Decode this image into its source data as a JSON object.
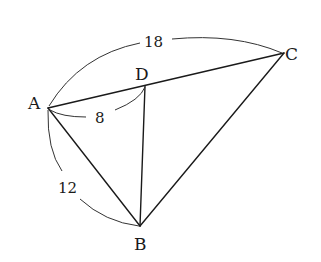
{
  "diagram": {
    "type": "geometry-triangle",
    "points": {
      "A": {
        "label": "A",
        "x": 48,
        "y": 108
      },
      "B": {
        "label": "B",
        "x": 140,
        "y": 226
      },
      "C": {
        "label": "C",
        "x": 284,
        "y": 53
      },
      "D": {
        "label": "D",
        "x": 145,
        "y": 86
      }
    },
    "segments": [
      {
        "from": "A",
        "to": "C"
      },
      {
        "from": "A",
        "to": "B"
      },
      {
        "from": "B",
        "to": "C"
      },
      {
        "from": "D",
        "to": "B"
      }
    ],
    "measurements": {
      "AC": "18",
      "AD": "8",
      "AB": "12"
    }
  }
}
